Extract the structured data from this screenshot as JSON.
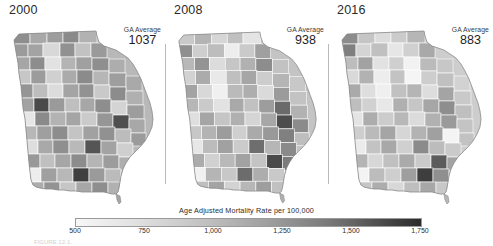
{
  "figure": {
    "legend_title": "Age Adjusted Mortality Rate per 100,000",
    "avg_caption": "GA Average",
    "bottom_caption": "FIGURE 12-1."
  },
  "panels": [
    {
      "year": "2000",
      "avg_caption": "GA Average",
      "avg_value": "1037"
    },
    {
      "year": "2008",
      "avg_caption": "GA Average",
      "avg_value": "938"
    },
    {
      "year": "2016",
      "avg_caption": "GA Average",
      "avg_value": "883"
    }
  ],
  "legend": {
    "title": "Age Adjusted Mortality Rate per 100,000",
    "ticks": [
      "500",
      "750",
      "1,000",
      "1,250",
      "1,500",
      "1,750"
    ],
    "low_color": "#f7f7f7",
    "high_color": "#2a2a2a"
  },
  "chart_data": {
    "type": "heatmap",
    "title": "Age Adjusted Mortality Rate per 100,000",
    "subtitle": "",
    "xlabel": "",
    "ylabel": "",
    "legend_position": "bottom",
    "grid": false,
    "colormap": "greys",
    "value_unit": "deaths per 100,000",
    "geography": "Georgia counties",
    "colorbar": {
      "label": "Age Adjusted Mortality Rate per 100,000",
      "ticks": [
        500,
        750,
        1000,
        1250,
        1500,
        1750
      ],
      "ticklabels": [
        "500",
        "750",
        "1,000",
        "1,250",
        "1,500",
        "1,750"
      ],
      "range": [
        500,
        1750
      ],
      "orientation": "horizontal"
    },
    "series": [
      {
        "name": "2000",
        "state_average": 1037
      },
      {
        "name": "2008",
        "state_average": 938
      },
      {
        "name": "2016",
        "state_average": 883
      }
    ],
    "categories": [
      "2000",
      "2008",
      "2016"
    ],
    "values": [
      1037,
      938,
      883
    ],
    "annotations": [
      "GA Average 1037",
      "GA Average 938",
      "GA Average 883"
    ]
  }
}
